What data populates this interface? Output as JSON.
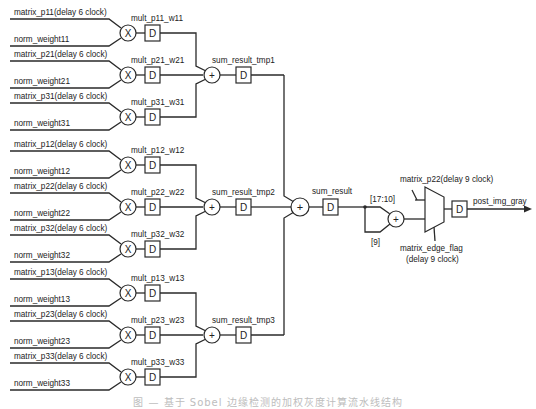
{
  "groups": [
    {
      "adder_y": 75,
      "sum_label": "sum_result_tmp1",
      "rows": [
        {
          "y": 33,
          "matrix": "matrix_p11(delay 6 clock)",
          "weight": "norm_weight11",
          "mult": "mult_p11_w11"
        },
        {
          "y": 75,
          "matrix": "matrix_p21(delay 6 clock)",
          "weight": "norm_weight21",
          "mult": "mult_p21_w21"
        },
        {
          "y": 117,
          "matrix": "matrix_p31(delay 6 clock)",
          "weight": "norm_weight31",
          "mult": "mult_p31_w31"
        }
      ]
    },
    {
      "adder_y": 207,
      "sum_label": "sum_result_tmp2",
      "rows": [
        {
          "y": 165,
          "matrix": "matrix_p12(delay 6 clock)",
          "weight": "norm_weight12",
          "mult": "mult_p12_w12"
        },
        {
          "y": 207,
          "matrix": "matrix_p22(delay 6 clock)",
          "weight": "norm_weight22",
          "mult": "mult_p22_w22"
        },
        {
          "y": 249,
          "matrix": "matrix_p32(delay 6 clock)",
          "weight": "norm_weight32",
          "mult": "mult_p32_w32"
        }
      ]
    },
    {
      "adder_y": 335,
      "sum_label": "sum_result_tmp3",
      "rows": [
        {
          "y": 293,
          "matrix": "matrix_p13(delay 6 clock)",
          "weight": "norm_weight13",
          "mult": "mult_p13_w13"
        },
        {
          "y": 335,
          "matrix": "matrix_p23(delay 6 clock)",
          "weight": "norm_weight23",
          "mult": "mult_p23_w23"
        },
        {
          "y": 377,
          "matrix": "matrix_p33(delay 6 clock)",
          "weight": "norm_weight33",
          "mult": "mult_p33_w33"
        }
      ]
    }
  ],
  "symbols": {
    "multiply": "X",
    "add": "+",
    "delay": "D"
  },
  "output_stage": {
    "sum_result_label": "sum_result",
    "bits_high": "[17:10]",
    "bits_low": "[9]",
    "mux_input_label": "matrix_p22(delay 9 clock)",
    "mux_select_label_1": "matrix_edge_flag",
    "mux_select_label_2": "(delay 9 clock)",
    "output_label": "post_img_gray"
  },
  "caption": "图 — 基于 Sobel 边缘检测的加权灰度计算流水线结构"
}
